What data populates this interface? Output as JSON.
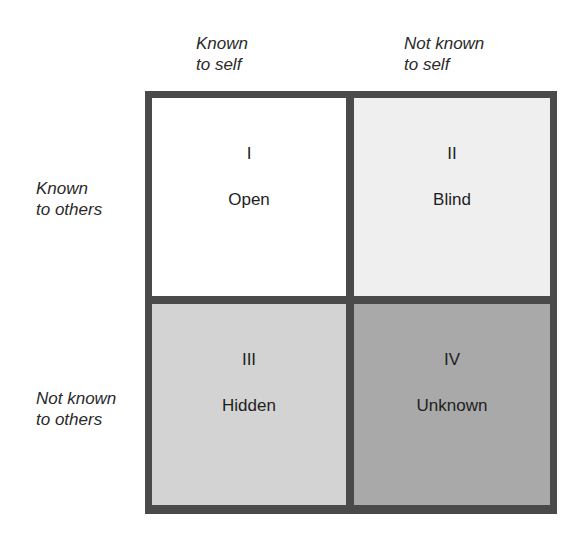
{
  "diagram": {
    "type": "johari-window",
    "columns": [
      {
        "line1": "Known",
        "line2": "to self"
      },
      {
        "line1": "Not known",
        "line2": "to self"
      }
    ],
    "rows": [
      {
        "line1": "Known",
        "line2": "to others"
      },
      {
        "line1": "Not known",
        "line2": "to others"
      }
    ],
    "quadrants": [
      {
        "numeral": "I",
        "name": "Open",
        "color": "#ffffff"
      },
      {
        "numeral": "II",
        "name": "Blind",
        "color": "#efefef"
      },
      {
        "numeral": "III",
        "name": "Hidden",
        "color": "#d3d3d3"
      },
      {
        "numeral": "IV",
        "name": "Unknown",
        "color": "#a9a9a9"
      }
    ],
    "border_color": "#4a4a4a"
  }
}
